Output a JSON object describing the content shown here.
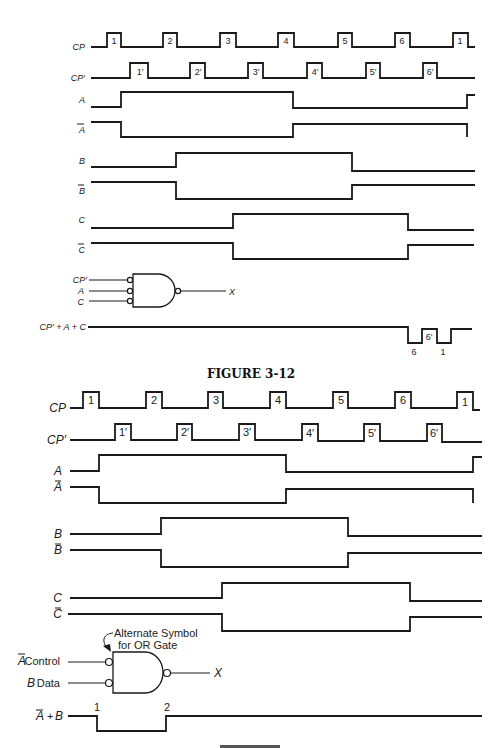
{
  "figure1": {
    "caption": "FIGURE 3-12",
    "signals": [
      {
        "name": "CP",
        "label": "CP"
      },
      {
        "name": "CP-prime",
        "label": "CP′"
      },
      {
        "name": "A",
        "label": "A"
      },
      {
        "name": "A-bar",
        "label": "A"
      },
      {
        "name": "B",
        "label": "B"
      },
      {
        "name": "B-bar",
        "label": "B"
      },
      {
        "name": "C",
        "label": "C"
      },
      {
        "name": "C-bar",
        "label": "C"
      }
    ],
    "cp_pulses": [
      "1",
      "2",
      "3",
      "4",
      "5",
      "6",
      "1"
    ],
    "cpp_pulses": [
      "1′",
      "2′",
      "3′",
      "4′",
      "5′",
      "6′"
    ],
    "gate": {
      "inputs": [
        "CP′",
        "A",
        "C"
      ],
      "output": "X"
    },
    "result": {
      "label": "CP′ + A + C",
      "pulse_labels": [
        "6",
        "6′",
        "1"
      ]
    }
  },
  "figure2": {
    "signals": [
      {
        "name": "CP",
        "label": "CP"
      },
      {
        "name": "CP-prime",
        "label": "CP′"
      },
      {
        "name": "A",
        "label": "A"
      },
      {
        "name": "A-bar",
        "label": "A"
      },
      {
        "name": "B",
        "label": "B"
      },
      {
        "name": "B-bar",
        "label": "B"
      },
      {
        "name": "C",
        "label": "C"
      },
      {
        "name": "C-bar",
        "label": "C"
      }
    ],
    "cp_pulses": [
      "1",
      "2",
      "3",
      "4",
      "5",
      "6",
      "1"
    ],
    "cpp_pulses": [
      "1′",
      "2′",
      "3′",
      "4′",
      "5′",
      "6′"
    ],
    "gate": {
      "annotation_line1": "Alternate Symbol",
      "annotation_line2": "for OR Gate",
      "input1_signal": "A",
      "input1_role": "Control",
      "input2_signal": "B",
      "input2_role": "Data",
      "output": "X"
    },
    "result": {
      "label_a": "A",
      "label_plus": "+",
      "label_b": "B",
      "edge_labels": [
        "1",
        "2"
      ]
    }
  }
}
